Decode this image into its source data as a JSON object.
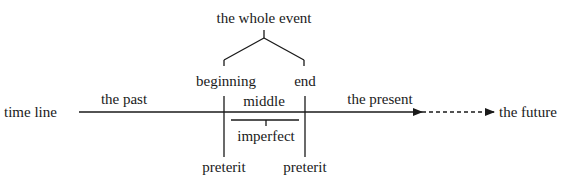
{
  "diagram": {
    "title": "the whole event",
    "parts": {
      "beginning": "beginning",
      "end": "end",
      "middle": "middle"
    },
    "timeline": {
      "label": "time line",
      "past": "the past",
      "present": "the present",
      "future": "the future"
    },
    "aspects": {
      "imperfect": "imperfect",
      "preterit_start": "preterit",
      "preterit_end": "preterit"
    },
    "colors": {
      "ink": "#1a1a1a",
      "background": "#ffffff"
    }
  }
}
